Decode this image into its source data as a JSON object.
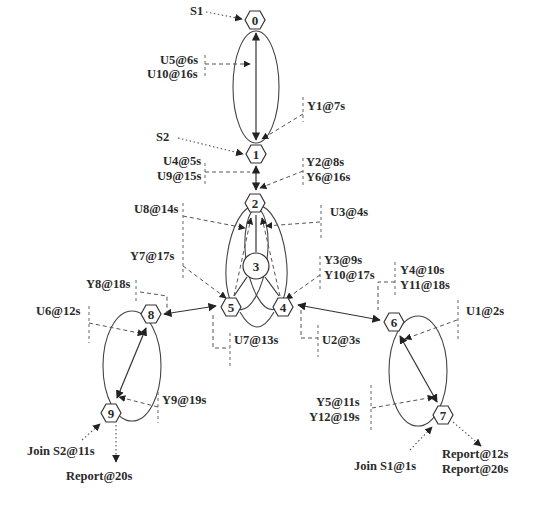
{
  "nodes": [
    {
      "id": "0",
      "label": "0",
      "shape": "hexagon",
      "x": 255,
      "y": 20
    },
    {
      "id": "1",
      "label": "1",
      "shape": "hexagon",
      "x": 256,
      "y": 154
    },
    {
      "id": "2",
      "label": "2",
      "shape": "hexagon",
      "x": 255,
      "y": 203
    },
    {
      "id": "3",
      "label": "3",
      "shape": "circle",
      "x": 256,
      "y": 266
    },
    {
      "id": "4",
      "label": "4",
      "shape": "hexagon",
      "x": 283,
      "y": 307
    },
    {
      "id": "5",
      "label": "5",
      "shape": "hexagon",
      "x": 231,
      "y": 307
    },
    {
      "id": "6",
      "label": "6",
      "shape": "hexagon",
      "x": 394,
      "y": 322
    },
    {
      "id": "7",
      "label": "7",
      "shape": "hexagon",
      "x": 443,
      "y": 415
    },
    {
      "id": "8",
      "label": "8",
      "shape": "hexagon",
      "x": 151,
      "y": 314
    },
    {
      "id": "9",
      "label": "9",
      "shape": "hexagon",
      "x": 111,
      "y": 413
    }
  ],
  "labels": {
    "s1": "S1",
    "s2": "S2",
    "u5": "U5@6s",
    "u10": "U10@16s",
    "y1": "Y1@7s",
    "u4": "U4@5s",
    "u9": "U9@15s",
    "y2": "Y2@8s",
    "y6": "Y6@16s",
    "u8": "U8@14s",
    "u3": "U3@4s",
    "y7": "Y7@17s",
    "y3": "Y3@9s",
    "y10": "Y10@17s",
    "y4": "Y4@10s",
    "y11": "Y11@18s",
    "y8": "Y8@18s",
    "u6": "U6@12s",
    "u7": "U7@13s",
    "u2": "U2@3s",
    "u1": "U1@2s",
    "y9": "Y9@19s",
    "y5": "Y5@11s",
    "y12": "Y12@19s",
    "join_s2": "Join S2@11s",
    "report_9": "Report@20s",
    "join_s1": "Join S1@1s",
    "report_7a": "Report@12s",
    "report_7b": "Report@20s"
  },
  "edges": [
    {
      "from": "0",
      "to": "1",
      "style": "solid",
      "bidirectional": true
    },
    {
      "from": "1",
      "to": "2",
      "style": "solid",
      "bidirectional": true
    },
    {
      "from": "2",
      "to": "3",
      "style": "solid"
    },
    {
      "from": "3",
      "to": "4",
      "style": "solid"
    },
    {
      "from": "3",
      "to": "5",
      "style": "solid"
    },
    {
      "from": "5",
      "to": "8",
      "style": "solid",
      "bidirectional": true
    },
    {
      "from": "4",
      "to": "6",
      "style": "solid",
      "bidirectional": true
    },
    {
      "from": "8",
      "to": "9",
      "style": "solid",
      "bidirectional": true
    },
    {
      "from": "6",
      "to": "7",
      "style": "solid",
      "bidirectional": true
    }
  ],
  "colors": {
    "stroke": "#333333",
    "text": "#2a2a2a",
    "background": "#ffffff"
  }
}
